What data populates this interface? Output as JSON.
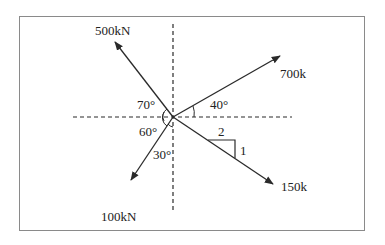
{
  "diagram": {
    "type": "force-vectors",
    "forces": [
      {
        "label": "500kN",
        "direction": "up-left",
        "angle_label": "70°"
      },
      {
        "label": "700k",
        "direction": "up-right",
        "angle_label": "40°"
      },
      {
        "label": "150k",
        "direction": "down-right",
        "slope": {
          "run": "2",
          "rise": "1"
        }
      },
      {
        "label": "100kN",
        "direction": "down-left",
        "angle_labels": [
          "60°",
          "30°"
        ]
      }
    ],
    "angles": {
      "a70": "70°",
      "a40": "40°",
      "a60": "60°",
      "a30": "30°"
    },
    "slope": {
      "run": "2",
      "rise": "1"
    },
    "colors": {
      "line": "#2a2a2a",
      "frame": "#8a8a8a"
    }
  }
}
